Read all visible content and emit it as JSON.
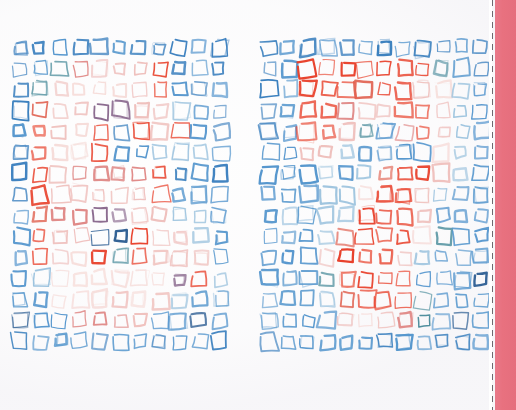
{
  "artwork": {
    "title": "Hand-drawn square grid diptych",
    "medium": "felt-tip pen on white paper, scanned",
    "background_color": "#fefefe",
    "canvas": {
      "width": 516,
      "height": 410
    }
  },
  "palette": {
    "blue_strong": "#3a7fbe",
    "blue_mid": "#5596cd",
    "blue_pale": "#9cc3de",
    "teal": "#4f8f9e",
    "red_strong": "#e8402a",
    "red_mid": "#e0604f",
    "pink_mid": "#e08a88",
    "pink_pale": "#efc0bd",
    "pink_faint": "#f6dcd9",
    "purple": "#8b6a8f",
    "navy": "#2c5d92",
    "band_pink": "#e8717f",
    "dash_gray": "#6e6a70"
  },
  "trim_edge": {
    "name": "printed-bleed-band",
    "gap_left": 489,
    "gap_width": 3,
    "dash_x": 492,
    "band_left": 495,
    "band_width": 21,
    "dash_color": "#6e6a70",
    "band_color": "#e8717f"
  },
  "grids": [
    {
      "id": "grid-left",
      "label": "Left square grid",
      "origin_x": 10,
      "origin_y": 37,
      "cols": 11,
      "rows": 15,
      "cell_w": 20.0,
      "cell_h": 21.0,
      "square_size": 13.5,
      "description": "Blue border squares surrounding a warm red/pink cluster skewed toward the upper-left-of-centre; strong red accents scattered through the middle rows.",
      "cells": [
        [
          "blue_strong",
          "blue_strong",
          "blue_mid",
          "blue_strong",
          "blue_strong",
          "blue_mid",
          "blue_strong",
          "blue_strong",
          "blue_strong",
          "blue_mid",
          "blue_strong"
        ],
        [
          "blue_strong",
          "blue_mid",
          "teal",
          "pink_mid",
          "pink_pale",
          "pink_pale",
          "pink_pale",
          "red_strong",
          "blue_strong",
          "blue_mid",
          "blue_strong"
        ],
        [
          "blue_strong",
          "teal",
          "pink_pale",
          "pink_faint",
          "pink_faint",
          "pink_faint",
          "pink_pale",
          "red_strong",
          "blue_mid",
          "blue_strong",
          "blue_mid"
        ],
        [
          "blue_strong",
          "red_mid",
          "pink_pale",
          "pink_pale",
          "purple",
          "purple",
          "pink_pale",
          "pink_pale",
          "blue_pale",
          "blue_mid",
          "blue_strong"
        ],
        [
          "blue_mid",
          "red_strong",
          "pink_pale",
          "pink_faint",
          "red_strong",
          "blue_strong",
          "red_strong",
          "pink_pale",
          "red_strong",
          "blue_mid",
          "blue_strong"
        ],
        [
          "blue_strong",
          "red_strong",
          "pink_faint",
          "pink_faint",
          "red_strong",
          "blue_mid",
          "blue_mid",
          "blue_pale",
          "blue_pale",
          "blue_pale",
          "blue_mid"
        ],
        [
          "blue_strong",
          "red_strong",
          "pink_pale",
          "pink_mid",
          "pink_mid",
          "pink_mid",
          "pink_mid",
          "red_strong",
          "blue_strong",
          "blue_mid",
          "blue_strong"
        ],
        [
          "blue_strong",
          "red_strong",
          "pink_pale",
          "pink_pale",
          "pink_pale",
          "pink_pale",
          "pink_pale",
          "red_strong",
          "blue_mid",
          "blue_mid",
          "blue_mid"
        ],
        [
          "blue_mid",
          "red_mid",
          "pink_mid",
          "pink_mid",
          "purple",
          "purple",
          "pink_pale",
          "pink_pale",
          "blue_pale",
          "blue_pale",
          "blue_mid"
        ],
        [
          "blue_mid",
          "red_strong",
          "pink_pale",
          "pink_pale",
          "navy",
          "navy",
          "red_strong",
          "pink_pale",
          "pink_pale",
          "blue_pale",
          "blue_mid"
        ],
        [
          "blue_mid",
          "red_strong",
          "pink_pale",
          "pink_faint",
          "red_strong",
          "teal",
          "red_strong",
          "pink_pale",
          "pink_pale",
          "pink_pale",
          "blue_mid"
        ],
        [
          "blue_mid",
          "blue_pale",
          "pink_faint",
          "pink_faint",
          "pink_faint",
          "pink_faint",
          "pink_faint",
          "pink_faint",
          "purple",
          "red_strong",
          "blue_pale"
        ],
        [
          "blue_mid",
          "blue_mid",
          "pink_faint",
          "pink_faint",
          "pink_faint",
          "pink_pale",
          "pink_faint",
          "pink_pale",
          "blue_pale",
          "blue_mid",
          "blue_mid"
        ],
        [
          "navy",
          "blue_mid",
          "blue_mid",
          "pink_mid",
          "pink_mid",
          "pink_mid",
          "pink_pale",
          "blue_mid",
          "blue_mid",
          "navy",
          "blue_mid"
        ],
        [
          "blue_strong",
          "blue_mid",
          "blue_mid",
          "blue_mid",
          "blue_strong",
          "blue_mid",
          "blue_mid",
          "blue_strong",
          "blue_mid",
          "blue_mid",
          "blue_strong"
        ]
      ]
    },
    {
      "id": "grid-right",
      "label": "Right square grid",
      "origin_x": 260,
      "origin_y": 37,
      "cols": 12,
      "rows": 15,
      "cell_w": 19.2,
      "cell_h": 21.0,
      "square_size": 13.5,
      "description": "Blue border squares framing a vivid red band across the upper rows that narrows into a central red spine descending through the middle of the grid.",
      "cells": [
        [
          "blue_strong",
          "blue_mid",
          "blue_strong",
          "blue_mid",
          "blue_strong",
          "blue_mid",
          "blue_strong",
          "blue_mid",
          "blue_strong",
          "blue_strong",
          "blue_mid",
          "blue_strong"
        ],
        [
          "blue_strong",
          "blue_mid",
          "red_strong",
          "red_strong",
          "red_strong",
          "red_strong",
          "red_strong",
          "red_strong",
          "red_strong",
          "teal",
          "blue_mid",
          "blue_strong"
        ],
        [
          "blue_strong",
          "blue_mid",
          "red_strong",
          "red_strong",
          "red_strong",
          "red_mid",
          "red_strong",
          "red_strong",
          "pink_pale",
          "pink_faint",
          "blue_pale",
          "blue_mid"
        ],
        [
          "blue_strong",
          "blue_mid",
          "red_strong",
          "red_strong",
          "pink_mid",
          "pink_pale",
          "pink_pale",
          "red_strong",
          "red_strong",
          "pink_pale",
          "blue_pale",
          "blue_mid"
        ],
        [
          "blue_strong",
          "blue_mid",
          "red_strong",
          "red_strong",
          "pink_pale",
          "teal",
          "blue_mid",
          "pink_mid",
          "red_strong",
          "pink_pale",
          "blue_pale",
          "blue_mid"
        ],
        [
          "blue_mid",
          "blue_mid",
          "pink_pale",
          "pink_pale",
          "blue_pale",
          "blue_mid",
          "blue_mid",
          "blue_mid",
          "blue_mid",
          "pink_faint",
          "blue_pale",
          "blue_mid"
        ],
        [
          "blue_mid",
          "blue_mid",
          "blue_mid",
          "blue_pale",
          "blue_mid",
          "blue_pale",
          "red_mid",
          "red_strong",
          "red_strong",
          "pink_pale",
          "blue_pale",
          "blue_mid"
        ],
        [
          "blue_mid",
          "blue_mid",
          "blue_mid",
          "blue_pale",
          "blue_pale",
          "pink_faint",
          "red_strong",
          "red_strong",
          "pink_pale",
          "blue_pale",
          "blue_mid",
          "blue_mid"
        ],
        [
          "blue_mid",
          "blue_pale",
          "blue_mid",
          "blue_pale",
          "blue_pale",
          "red_strong",
          "red_strong",
          "red_strong",
          "pink_pale",
          "blue_mid",
          "blue_mid",
          "blue_mid"
        ],
        [
          "blue_mid",
          "blue_mid",
          "blue_mid",
          "blue_pale",
          "red_mid",
          "red_strong",
          "red_strong",
          "red_strong",
          "pink_faint",
          "teal",
          "blue_mid",
          "blue_mid"
        ],
        [
          "blue_mid",
          "blue_mid",
          "blue_mid",
          "pink_pale",
          "red_strong",
          "red_strong",
          "red_strong",
          "pink_pale",
          "blue_pale",
          "blue_mid",
          "blue_mid",
          "blue_mid"
        ],
        [
          "blue_mid",
          "blue_mid",
          "blue_mid",
          "teal",
          "red_strong",
          "red_strong",
          "red_strong",
          "red_strong",
          "blue_mid",
          "blue_mid",
          "blue_mid",
          "navy"
        ],
        [
          "blue_mid",
          "blue_mid",
          "blue_mid",
          "blue_pale",
          "red_mid",
          "red_strong",
          "red_strong",
          "red_strong",
          "teal",
          "blue_mid",
          "blue_mid",
          "blue_mid"
        ],
        [
          "blue_mid",
          "blue_mid",
          "blue_mid",
          "blue_mid",
          "pink_pale",
          "pink_faint",
          "pink_pale",
          "pink_mid",
          "teal",
          "blue_mid",
          "navy",
          "blue_mid"
        ],
        [
          "blue_strong",
          "blue_mid",
          "blue_mid",
          "blue_mid",
          "blue_mid",
          "blue_mid",
          "blue_strong",
          "blue_mid",
          "blue_mid",
          "blue_strong",
          "blue_strong",
          "blue_mid"
        ]
      ]
    }
  ]
}
